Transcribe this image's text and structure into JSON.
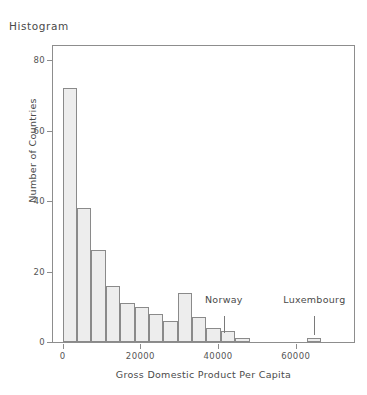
{
  "chart_data": {
    "type": "bar",
    "title": "Histogram",
    "xlabel": "Gross Domestic Product Per Capita",
    "ylabel": "Number of Countries",
    "xlim": [
      -2500,
      75000
    ],
    "ylim": [
      0,
      84
    ],
    "grid": false,
    "legend": null,
    "bin_width": 3700,
    "xticks": [
      0,
      20000,
      40000,
      60000
    ],
    "xtick_labels": [
      "0",
      "20000",
      "40000",
      "60000"
    ],
    "yticks": [
      0,
      20,
      40,
      60,
      80
    ],
    "ytick_labels": [
      "0",
      "20",
      "40",
      "60",
      "80"
    ],
    "bins": [
      {
        "x0": 0,
        "x1": 3700,
        "value": 72
      },
      {
        "x0": 3700,
        "x1": 7400,
        "value": 38
      },
      {
        "x0": 7400,
        "x1": 11100,
        "value": 26
      },
      {
        "x0": 11100,
        "x1": 14800,
        "value": 16
      },
      {
        "x0": 14800,
        "x1": 18500,
        "value": 11
      },
      {
        "x0": 18500,
        "x1": 22200,
        "value": 10
      },
      {
        "x0": 22200,
        "x1": 25900,
        "value": 8
      },
      {
        "x0": 25900,
        "x1": 29600,
        "value": 6
      },
      {
        "x0": 29600,
        "x1": 33300,
        "value": 14
      },
      {
        "x0": 33300,
        "x1": 37000,
        "value": 7
      },
      {
        "x0": 37000,
        "x1": 40700,
        "value": 4
      },
      {
        "x0": 40700,
        "x1": 44400,
        "value": 3
      },
      {
        "x0": 44400,
        "x1": 48100,
        "value": 1
      },
      {
        "x0": 48100,
        "x1": 51800,
        "value": 0
      },
      {
        "x0": 51800,
        "x1": 55500,
        "value": 0
      },
      {
        "x0": 55500,
        "x1": 59200,
        "value": 0
      },
      {
        "x0": 59200,
        "x1": 62900,
        "value": 0
      },
      {
        "x0": 62900,
        "x1": 66600,
        "value": 1
      }
    ],
    "categories": [
      "0-3700",
      "3700-7400",
      "7400-11100",
      "11100-14800",
      "14800-18500",
      "18500-22200",
      "22200-25900",
      "25900-29600",
      "29600-33300",
      "33300-37000",
      "37000-40700",
      "40700-44400",
      "44400-48100",
      "48100-51800",
      "51800-55500",
      "55500-59200",
      "59200-62900",
      "62900-66600"
    ],
    "values": [
      72,
      38,
      26,
      16,
      11,
      10,
      8,
      6,
      14,
      7,
      4,
      3,
      1,
      0,
      0,
      0,
      0,
      1
    ],
    "annotations": [
      {
        "label": "Norway",
        "x": 41500,
        "text_y": 10.5,
        "line_top_y": 7.5,
        "line_bottom_y": 2.5
      },
      {
        "label": "Luxembourg",
        "x": 64800,
        "text_y": 10.5,
        "line_top_y": 7.5,
        "line_bottom_y": 2.0
      }
    ],
    "colors": {
      "bar_fill": "#ededed",
      "bar_edge": "#8a8a8a",
      "frame": "#8d8d8d",
      "text": "#4a4a4a",
      "tick_text": "#555555",
      "background": "#ffffff"
    }
  }
}
